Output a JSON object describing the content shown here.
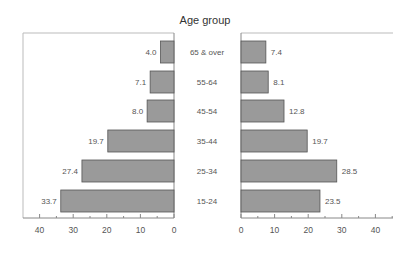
{
  "chart_data": {
    "type": "bar",
    "orientation": "horizontal",
    "layout": "back-to-back (butterfly)",
    "title": "Age group",
    "categories": [
      "65 & over",
      "55-64",
      "45-54",
      "35-44",
      "25-34",
      "15-24"
    ],
    "series": [
      {
        "name": "left",
        "side": "left",
        "values": [
          4.0,
          7.1,
          8.0,
          19.7,
          27.4,
          33.7
        ]
      },
      {
        "name": "right",
        "side": "right",
        "values": [
          7.4,
          8.1,
          12.8,
          19.7,
          28.5,
          23.5
        ]
      }
    ],
    "value_labels_left": [
      "4.0",
      "7.1",
      "8.0",
      "19.7",
      "27.4",
      "33.7"
    ],
    "value_labels_right": [
      "7.4",
      "8.1",
      "12.8",
      "19.7",
      "28.5",
      "23.5"
    ],
    "left_axis": {
      "ticks": [
        "40",
        "30",
        "20",
        "10",
        "0"
      ],
      "range": [
        45,
        0
      ],
      "reversed": true
    },
    "right_axis": {
      "ticks": [
        "0",
        "10",
        "20",
        "30",
        "40"
      ],
      "range": [
        0,
        45
      ]
    },
    "xlabel": "",
    "ylabel": "",
    "grid": false,
    "legend": "none",
    "colors": {
      "bar_fill": "#9a9a9a",
      "bar_edge": "#555555",
      "frame": "#bbbbbb"
    }
  }
}
